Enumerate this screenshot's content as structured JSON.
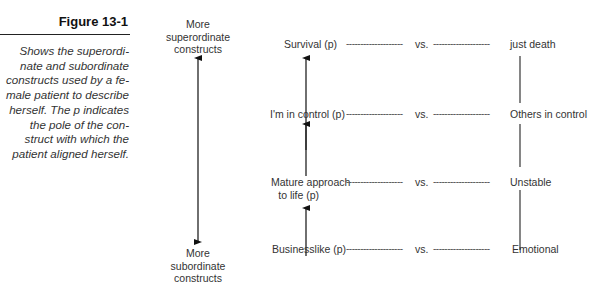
{
  "figure": {
    "title": "Figure 13-1",
    "caption": "Shows the superordinate and subordinate constructs used by a female patient to describe herself. The p indicates the pole of the construct with which the patient aligned herself.",
    "caption_lines": [
      "Shows the superordi-",
      "nate and subordinate",
      "constructs used by a fe-",
      "male patient to describe",
      "herself. The p indicates",
      "the pole of the con-",
      "struct with which the",
      "patient aligned herself."
    ]
  },
  "axis": {
    "top_label": [
      "More",
      "superordinate",
      "constructs"
    ],
    "bottom_label": [
      "More",
      "subordinate",
      "constructs"
    ]
  },
  "separator": "vs.",
  "dashes": "--------------------",
  "constructs": [
    {
      "left": "Survival (p)",
      "left_line2": "",
      "right": "just death"
    },
    {
      "left": "I'm in control (p)",
      "left_line2": "",
      "right": "Others in control"
    },
    {
      "left": "Mature approach",
      "left_line2": "to life (p)",
      "right": "Unstable"
    },
    {
      "left": "Businesslike (p)",
      "left_line2": "",
      "right": "Emotional"
    }
  ]
}
